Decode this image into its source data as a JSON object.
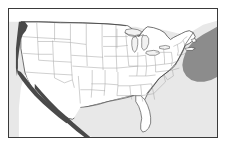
{
  "figure": {
    "kind": "map",
    "title": "Outline map of the contiguous United States",
    "frame_color": "#3a3a3a",
    "page_background": "#ffffff"
  },
  "map": {
    "region": "Contiguous United States",
    "projection_style": "conic",
    "land_fill": "#ffffff",
    "land_outline_color": "#333333",
    "state_border_color": "#a8a8a8",
    "ocean_fill": "#e8e8e8",
    "ocean_label": "ocean",
    "gulf_label": "Gulf of Mexico",
    "atlantic_label": "Atlantic Ocean",
    "pacific_label": "Pacific Ocean",
    "highlight": {
      "name": "Atlantic offshore highlight",
      "location": "off the Northeast and mid-Atlantic coast",
      "fill": "#8c8c8c"
    },
    "coastal_shading": {
      "name": "Pacific and Baja coastal shading",
      "location": "Pacific coast from Washington to Baja California",
      "fill": "#4a4a4a"
    },
    "features": [
      "Great Lakes",
      "Florida peninsula",
      "Baja California",
      "Chesapeake Bay",
      "Long Island",
      "Cape Cod",
      "Puget Sound"
    ]
  }
}
